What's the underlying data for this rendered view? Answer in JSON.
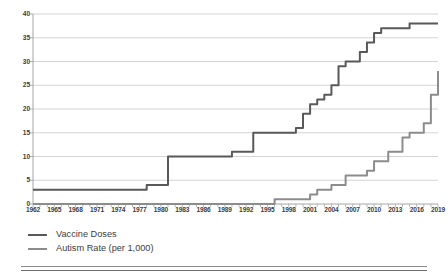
{
  "chart_data": {
    "type": "line",
    "title": "",
    "subtitle": "",
    "xlabel": "",
    "ylabel": "",
    "xlim": [
      1962,
      2019
    ],
    "ylim": [
      0,
      40
    ],
    "yticks": [
      0,
      5,
      10,
      15,
      20,
      25,
      30,
      35,
      40
    ],
    "xticks": [
      1962,
      1965,
      1968,
      1971,
      1974,
      1977,
      1980,
      1983,
      1986,
      1989,
      1992,
      1995,
      1998,
      2001,
      2004,
      2007,
      2010,
      2013,
      2016,
      2019
    ],
    "grid": "horizontal",
    "legend_position": "below-left",
    "x": [
      1962,
      1963,
      1964,
      1965,
      1966,
      1967,
      1968,
      1969,
      1970,
      1971,
      1972,
      1973,
      1974,
      1975,
      1976,
      1977,
      1978,
      1979,
      1980,
      1981,
      1982,
      1983,
      1984,
      1985,
      1986,
      1987,
      1988,
      1989,
      1990,
      1991,
      1992,
      1993,
      1994,
      1995,
      1996,
      1997,
      1998,
      1999,
      2000,
      2001,
      2002,
      2003,
      2004,
      2005,
      2006,
      2007,
      2008,
      2009,
      2010,
      2011,
      2012,
      2013,
      2014,
      2015,
      2016,
      2017,
      2018,
      2019
    ],
    "series": [
      {
        "name": "Vaccine Doses",
        "color": "#595959",
        "values": [
          3,
          3,
          3,
          3,
          3,
          3,
          3,
          3,
          3,
          3,
          3,
          3,
          3,
          3,
          3,
          3,
          4,
          4,
          4,
          10,
          10,
          10,
          10,
          10,
          10,
          10,
          10,
          10,
          11,
          11,
          11,
          15,
          15,
          15,
          15,
          15,
          15,
          16,
          19,
          21,
          22,
          23,
          25,
          29,
          30,
          30,
          32,
          34,
          36,
          37,
          37,
          37,
          37,
          38,
          38,
          38,
          38,
          38
        ]
      },
      {
        "name": "Autism Rate (per 1,000)",
        "color": "#8c8c8c",
        "values": [
          0,
          0,
          0,
          0,
          0,
          0,
          0,
          0,
          0,
          0,
          0,
          0,
          0,
          0,
          0,
          0,
          0,
          0,
          0,
          0,
          0,
          0,
          0,
          0,
          0,
          0,
          0,
          0,
          0,
          0,
          0,
          0,
          0,
          0,
          1,
          1,
          1,
          1,
          1,
          2,
          3,
          3,
          4,
          4,
          6,
          6,
          6,
          7,
          9,
          9,
          11,
          11,
          14,
          15,
          15,
          17,
          23,
          28
        ]
      }
    ]
  },
  "legend": {
    "items": [
      {
        "label": "Vaccine Doses",
        "color": "#595959"
      },
      {
        "label": "Autism Rate (per 1,000)",
        "color": "#8c8c8c"
      }
    ]
  },
  "axes": {
    "y_labels": [
      "40",
      "35",
      "30",
      "25",
      "20",
      "15",
      "10",
      "5",
      "0"
    ],
    "x_labels": [
      "1962",
      "1965",
      "1968",
      "1971",
      "1974",
      "1977",
      "1980",
      "1983",
      "1986",
      "1989",
      "1992",
      "1995",
      "1998",
      "2001",
      "2004",
      "2007",
      "2010",
      "2013",
      "2016",
      "2019"
    ]
  },
  "colors": {
    "gridline": "#c9c9c9",
    "axis": "#a6a6a6",
    "text": "#3b3b3b",
    "background": "#ffffff"
  }
}
